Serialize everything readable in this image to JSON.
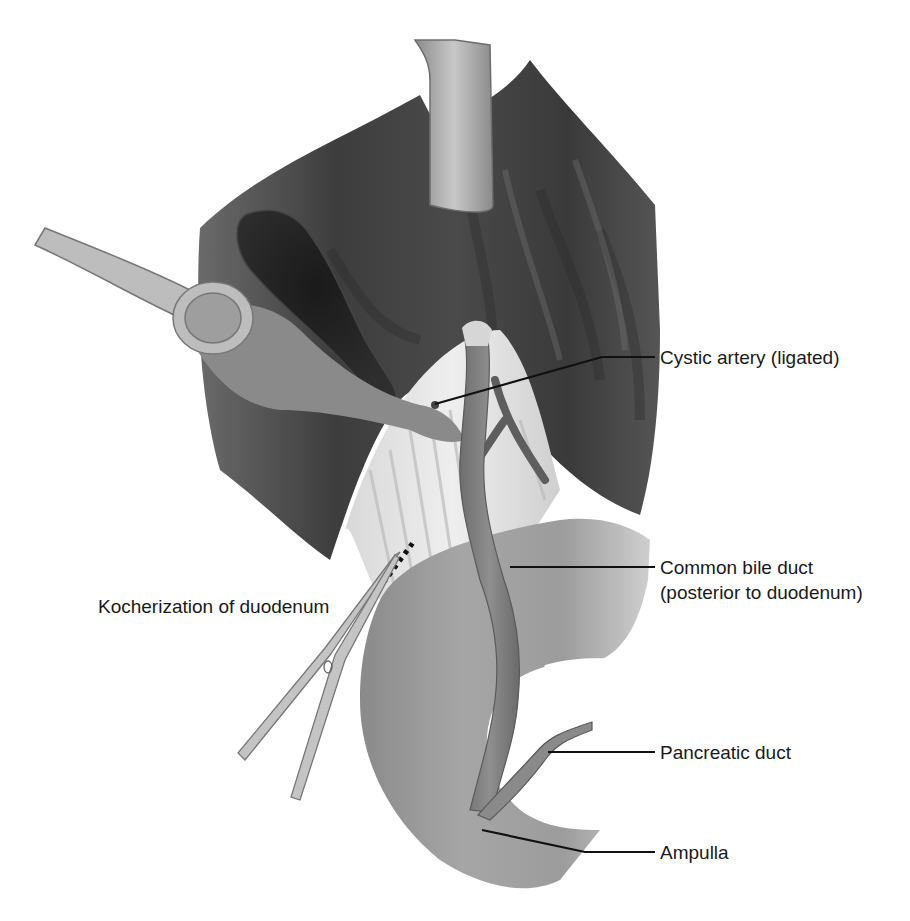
{
  "figure": {
    "labels": {
      "cystic_artery": "Cystic artery (ligated)",
      "common_bile_duct_line1": "Common bile duct",
      "common_bile_duct_line2": "(posterior to duodenum)",
      "kocherization": "Kocherization of duodenum",
      "pancreatic_duct": "Pancreatic duct",
      "ampulla": "Ampulla"
    },
    "colors": {
      "background": "#ffffff",
      "liver_dark": "#3a3a3a",
      "liver_mid": "#5a5a5a",
      "gallbladder": "#1e1e1e",
      "duodenum": "#9a9a9a",
      "bile_duct": "#7d7d7d",
      "instrument": "#b8b8b8",
      "leader_line": "#111111",
      "label_text": "#1a1a1a"
    }
  }
}
